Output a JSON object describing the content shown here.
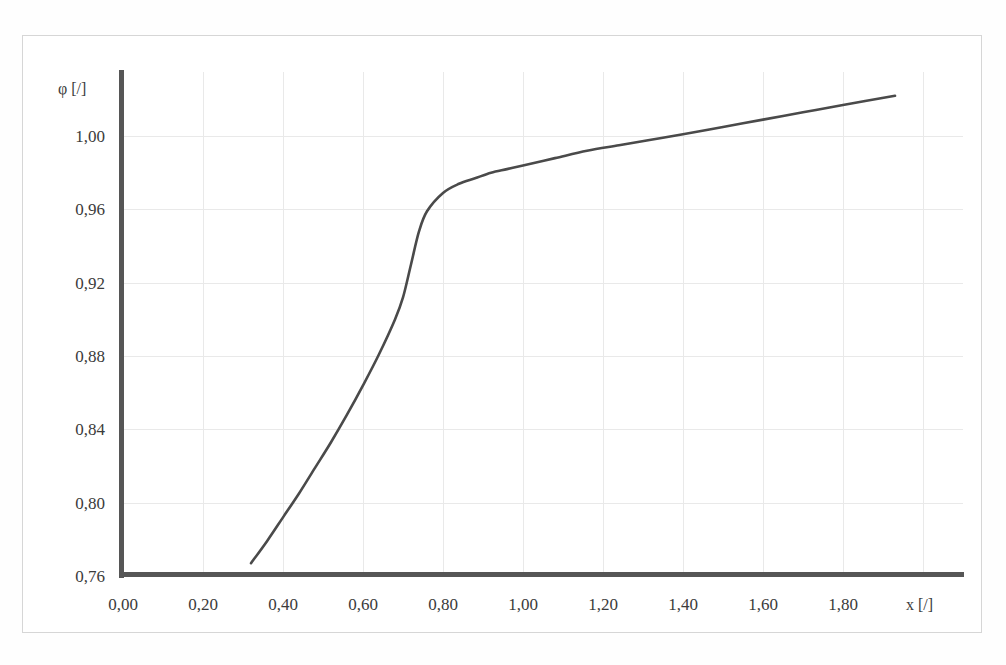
{
  "figure": {
    "top_clipped_text": "",
    "frame_color": "#d6d6d6",
    "axis_color": "#565656",
    "grid_color": "#e9e9e9",
    "curve_color": "#4a4a4a",
    "background": "#ffffff"
  },
  "chart_data": {
    "type": "line",
    "title": "",
    "xlabel": "x [/]",
    "ylabel": "φ [/]",
    "xlim": [
      0.0,
      2.1
    ],
    "ylim": [
      0.76,
      1.035
    ],
    "grid": true,
    "legend": null,
    "x_ticks": [
      "0,00",
      "0,20",
      "0,40",
      "0,60",
      "0,80",
      "1,00",
      "1,20",
      "1,40",
      "1,60",
      "1,80"
    ],
    "x_tick_values": [
      0.0,
      0.2,
      0.4,
      0.6,
      0.8,
      1.0,
      1.2,
      1.4,
      1.6,
      1.8
    ],
    "y_ticks": [
      "0,76",
      "0,80",
      "0,84",
      "0,88",
      "0,92",
      "0,96",
      "1,00"
    ],
    "y_tick_values": [
      0.76,
      0.8,
      0.84,
      0.88,
      0.92,
      0.96,
      1.0
    ],
    "series": [
      {
        "name": "phi(x)",
        "color": "#4a4a4a",
        "x": [
          0.32,
          0.36,
          0.4,
          0.44,
          0.48,
          0.52,
          0.56,
          0.6,
          0.64,
          0.68,
          0.7,
          0.72,
          0.74,
          0.76,
          0.8,
          0.84,
          0.88,
          0.92,
          0.96,
          1.0,
          1.08,
          1.16,
          1.24,
          1.32,
          1.4,
          1.5,
          1.6,
          1.7,
          1.8,
          1.93
        ],
        "y": [
          0.767,
          0.779,
          0.792,
          0.805,
          0.819,
          0.833,
          0.848,
          0.864,
          0.881,
          0.9,
          0.912,
          0.93,
          0.948,
          0.959,
          0.969,
          0.974,
          0.977,
          0.98,
          0.982,
          0.984,
          0.988,
          0.992,
          0.995,
          0.998,
          1.001,
          1.005,
          1.009,
          1.013,
          1.017,
          1.022
        ]
      }
    ],
    "annotations": [
      {
        "text": "knee",
        "x": 0.72,
        "y": 0.972,
        "visible": false
      }
    ]
  }
}
